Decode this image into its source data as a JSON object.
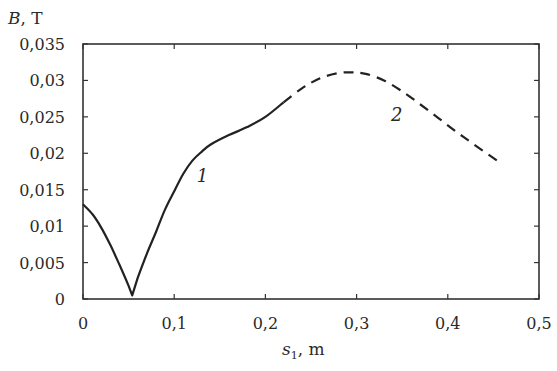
{
  "chart_data": {
    "type": "line",
    "title": "",
    "xlabel": "s_1, m",
    "ylabel": "B, T",
    "xlim": [
      0,
      0.5
    ],
    "ylim": [
      0,
      0.035
    ],
    "grid": false,
    "legend": "none (inline curve labels)",
    "x_ticks": [
      "0",
      "0,1",
      "0,2",
      "0,3",
      "0,4",
      "0,5"
    ],
    "x_tick_values": [
      0,
      0.1,
      0.2,
      0.3,
      0.4,
      0.5
    ],
    "y_ticks": [
      "0",
      "0,005",
      "0,01",
      "0,015",
      "0,02",
      "0,025",
      "0,03",
      "0,035"
    ],
    "y_tick_values": [
      0,
      0.005,
      0.01,
      0.015,
      0.02,
      0.025,
      0.03,
      0.035
    ],
    "series": [
      {
        "name": "1",
        "style": "solid",
        "x": [
          0,
          0.01,
          0.02,
          0.03,
          0.04,
          0.05,
          0.054,
          0.06,
          0.07,
          0.08,
          0.09,
          0.1,
          0.11,
          0.12,
          0.13,
          0.14,
          0.16,
          0.18,
          0.2,
          0.22
        ],
        "y": [
          0.013,
          0.0117,
          0.0098,
          0.0074,
          0.0047,
          0.0018,
          0.0005,
          0.0029,
          0.0062,
          0.0092,
          0.0123,
          0.0148,
          0.0172,
          0.019,
          0.0202,
          0.0212,
          0.0225,
          0.0236,
          0.025,
          0.027
        ]
      },
      {
        "name": "2",
        "style": "dashed",
        "x": [
          0.22,
          0.24,
          0.26,
          0.28,
          0.295,
          0.31,
          0.33,
          0.35,
          0.37,
          0.39,
          0.41,
          0.43,
          0.454
        ],
        "y": [
          0.027,
          0.0289,
          0.0303,
          0.031,
          0.0311,
          0.0309,
          0.03,
          0.0285,
          0.0267,
          0.0248,
          0.0229,
          0.0211,
          0.019
        ]
      }
    ],
    "annotations": [
      {
        "text": "1",
        "x": 0.131,
        "y": 0.016
      },
      {
        "text": "2",
        "x": 0.344,
        "y": 0.0245
      }
    ]
  },
  "labels": {
    "ylabel_main": "B",
    "ylabel_unit": ",  T",
    "xlabel_main": "s",
    "xlabel_sub": "1",
    "xlabel_unit": ",  m"
  }
}
